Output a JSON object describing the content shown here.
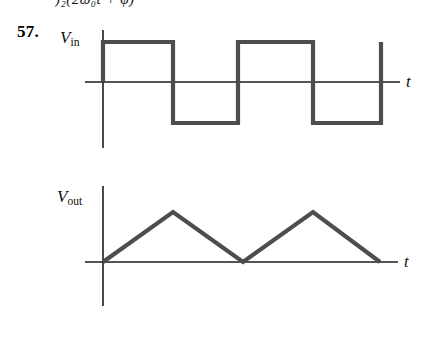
{
  "page": {
    "top_fragment": ")₂(2ω₀t + φ)",
    "problem_number": "57.",
    "background_color": "#ffffff",
    "wave_color": "#4d4d4d",
    "axis_color": "#1c1c1c"
  },
  "plots": [
    {
      "id": "vin",
      "y_axis_label": "V",
      "y_axis_subscript": "in",
      "x_axis_label": "t",
      "description": "Input square wave alternating between +V and -V"
    },
    {
      "id": "vout",
      "y_axis_label": "V",
      "y_axis_subscript": "out",
      "x_axis_label": "t",
      "description": "Output triangular wave, non-negative, two peaks"
    }
  ],
  "chart_data": [
    {
      "type": "line",
      "title": "V_in",
      "xlabel": "t",
      "ylabel": "V_in",
      "waveform": "square",
      "xlim": [
        0,
        4
      ],
      "ylim": [
        -1.2,
        1.2
      ],
      "grid": false,
      "legend": null,
      "x": [
        0,
        0,
        1,
        1,
        2,
        2,
        3,
        3,
        4,
        4
      ],
      "y": [
        0,
        1,
        1,
        -1,
        -1,
        1,
        1,
        -1,
        -1,
        1
      ],
      "axis_geometry": {
        "y_axis_x": 103,
        "zero_line_y": 82,
        "high_y": 42,
        "low_y": 123,
        "x_start": 103,
        "x_end": 381,
        "transitions_x": [
          103,
          173,
          238,
          313,
          381
        ],
        "y_axis_top": 30,
        "y_axis_bottom": 148,
        "x_axis_left": 85,
        "x_axis_right": 400
      }
    },
    {
      "type": "line",
      "title": "V_out",
      "xlabel": "t",
      "ylabel": "V_out",
      "waveform": "triangle",
      "xlim": [
        0,
        4
      ],
      "ylim": [
        0,
        1.2
      ],
      "grid": false,
      "legend": null,
      "x": [
        0,
        1,
        2,
        3,
        4
      ],
      "y": [
        0,
        1,
        0,
        1,
        0
      ],
      "axis_geometry": {
        "y_axis_x": 103,
        "zero_line_y": 262,
        "peak_y": 212,
        "x_start": 103,
        "x_end": 380,
        "vertices_x": [
          103,
          173,
          243,
          313,
          380
        ],
        "y_axis_top": 186,
        "y_axis_bottom": 306,
        "x_axis_left": 85,
        "x_axis_right": 398
      }
    }
  ]
}
